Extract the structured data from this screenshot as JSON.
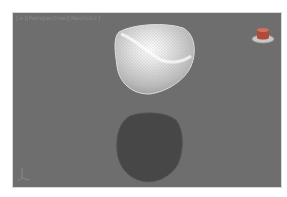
{
  "viewport": {
    "label": "[+][Perspective][Realistic]",
    "background": "#6e6e6e"
  },
  "objects": [
    {
      "name": "shaded-surface",
      "style": "light-gray wireframe with highlight"
    },
    {
      "name": "shadow-surface",
      "style": "dark flat"
    }
  ],
  "icons": {
    "home": "viewcube-home-icon",
    "axis": "axis-tripod-icon"
  }
}
